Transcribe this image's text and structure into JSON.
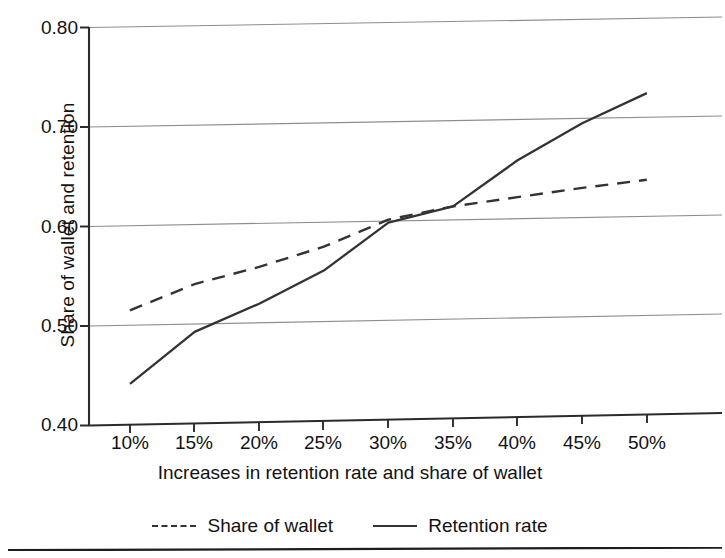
{
  "chart_data": {
    "type": "line",
    "title": "",
    "xlabel": "Increases in retention rate and share of wallet",
    "ylabel": "Share of wallet and retention",
    "categories": [
      "10%",
      "15%",
      "20%",
      "25%",
      "30%",
      "35%",
      "40%",
      "45%",
      "50%"
    ],
    "x": [
      10,
      15,
      20,
      25,
      30,
      35,
      40,
      45,
      50
    ],
    "xtick_labels": [
      "10%",
      "15%",
      "20%",
      "25%",
      "30%",
      "35%",
      "40%",
      "45%",
      "50%"
    ],
    "ytick_labels": [
      "0.40",
      "0.50",
      "0.60",
      "0.70",
      "0.80"
    ],
    "yticks": [
      0.4,
      0.5,
      0.6,
      0.7,
      0.8
    ],
    "ylim": [
      0.4,
      0.8
    ],
    "xlim": [
      7.5,
      52.5
    ],
    "grid": "horizontal",
    "legend_position": "below-axes",
    "series": [
      {
        "name": "Share of wallet",
        "style": "dashed",
        "color": "#333333",
        "values": [
          0.515,
          0.54,
          0.556,
          0.575,
          0.601,
          0.613,
          0.621,
          0.629,
          0.636
        ]
      },
      {
        "name": "Retention rate",
        "style": "solid",
        "color": "#333333",
        "values": [
          0.441,
          0.492,
          0.519,
          0.551,
          0.598,
          0.613,
          0.658,
          0.694,
          0.723
        ]
      }
    ]
  },
  "legend": {
    "items": [
      {
        "label": "Share of wallet",
        "marker": "dashed-line-icon"
      },
      {
        "label": "Retention rate",
        "marker": "solid-line-icon"
      }
    ]
  },
  "axes": {
    "y_title": "Share of wallet and retention",
    "x_title": "Increases in retention rate and share of wallet"
  }
}
